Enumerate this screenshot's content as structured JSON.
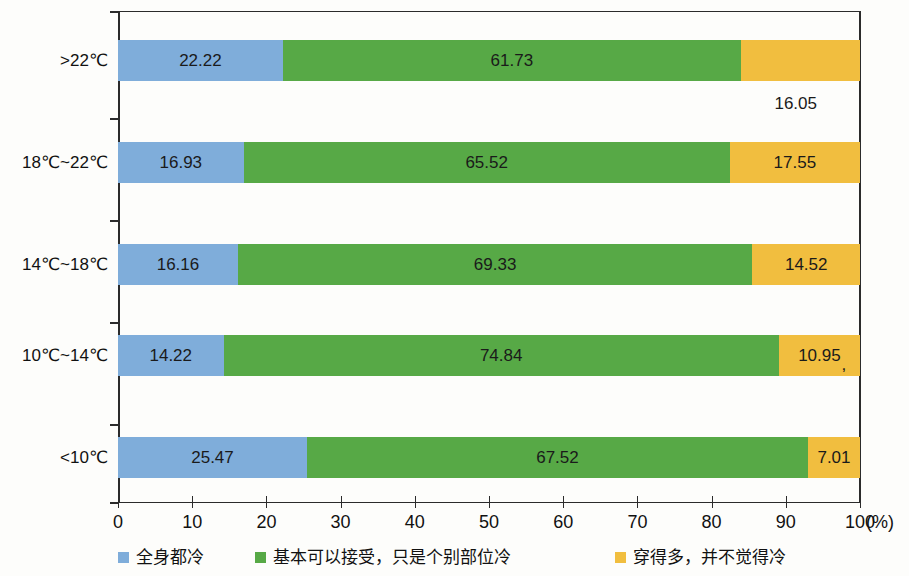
{
  "chart_data": {
    "type": "bar",
    "orientation": "horizontal",
    "stacked": true,
    "title": "",
    "xlabel": "(%)",
    "ylabel": "",
    "xlim": [
      0,
      100
    ],
    "grid": false,
    "legend_position": "bottom",
    "categories": [
      ">22℃",
      "18℃~22℃",
      "14℃~18℃",
      "10℃~14℃",
      "<10℃"
    ],
    "xticks": [
      "0",
      "10",
      "20",
      "30",
      "40",
      "50",
      "60",
      "70",
      "80",
      "90",
      "100"
    ],
    "xtick_values": [
      0,
      10,
      20,
      30,
      40,
      50,
      60,
      70,
      80,
      90,
      100
    ],
    "series": [
      {
        "name": "全身都冷",
        "color": "#7FADDA",
        "values": [
          22.22,
          16.93,
          16.16,
          14.22,
          25.47
        ],
        "labels": [
          "22.22",
          "16.93",
          "16.16",
          "14.22",
          "25.47"
        ]
      },
      {
        "name": "基本可以接受，只是个别部位冷",
        "color": "#57A946",
        "values": [
          61.73,
          65.52,
          69.33,
          74.84,
          67.52
        ],
        "labels": [
          "61.73",
          "65.52",
          "69.33",
          "74.84",
          "67.52"
        ]
      },
      {
        "name": "穿得多，并不觉得冷",
        "color": "#F1BE3F",
        "values": [
          16.05,
          17.55,
          14.52,
          10.95,
          7.01
        ],
        "labels": [
          "16.05",
          "17.55",
          "14.52",
          "10.95",
          "7.01"
        ]
      }
    ],
    "annotations": [
      {
        "text": ",",
        "note": "stray comma artifact right of 10.95 label"
      }
    ]
  },
  "axis": {
    "unit": "(%)"
  },
  "legend": {
    "items": [
      {
        "label": "全身都冷",
        "color": "#7FADDA"
      },
      {
        "label": "基本可以接受，只是个别部位冷",
        "color": "#57A946"
      },
      {
        "label": "穿得多，并不觉得冷",
        "color": "#F1BE3F"
      }
    ]
  },
  "stray": {
    "comma": ","
  }
}
